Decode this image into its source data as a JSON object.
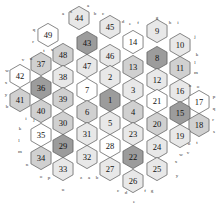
{
  "diagram": {
    "canvas": {
      "width": 220,
      "height": 209,
      "background": "#ffffff"
    },
    "hex": {
      "radius": 11.6,
      "orientation": "pointy-top-flat-side-horizontal",
      "stroke": "#555555",
      "stroke_width": 0.7
    },
    "palette": {
      "white": "#ffffff",
      "light": "#e8e8e8",
      "mid": "#d0d0d0",
      "dark": "#9c9c9c",
      "stroke": "#555555",
      "text": "#111111",
      "edge_text": "#333333"
    },
    "cells": [
      {
        "label": "44",
        "x": 79,
        "y": 18,
        "shade": "light"
      },
      {
        "label": "45",
        "x": 110,
        "y": 27,
        "shade": "light"
      },
      {
        "label": "9",
        "x": 157,
        "y": 31,
        "shade": "light"
      },
      {
        "label": "49",
        "x": 48,
        "y": 35,
        "shade": "white"
      },
      {
        "label": "43",
        "x": 87,
        "y": 43,
        "shade": "dark"
      },
      {
        "label": "14",
        "x": 133,
        "y": 42,
        "shade": "white"
      },
      {
        "label": "10",
        "x": 180,
        "y": 45,
        "shade": "light"
      },
      {
        "label": "48",
        "x": 63,
        "y": 55,
        "shade": "mid"
      },
      {
        "label": "46",
        "x": 110,
        "y": 56,
        "shade": "light"
      },
      {
        "label": "8",
        "x": 157,
        "y": 58,
        "shade": "dark"
      },
      {
        "label": "37",
        "x": 41,
        "y": 64,
        "shade": "mid"
      },
      {
        "label": "47",
        "x": 87,
        "y": 66,
        "shade": "light"
      },
      {
        "label": "13",
        "x": 133,
        "y": 67,
        "shade": "mid"
      },
      {
        "label": "11",
        "x": 180,
        "y": 68,
        "shade": "mid"
      },
      {
        "label": "42",
        "x": 20,
        "y": 76,
        "shade": "white"
      },
      {
        "label": "38",
        "x": 63,
        "y": 77,
        "shade": "light"
      },
      {
        "label": "2",
        "x": 110,
        "y": 77,
        "shade": "light"
      },
      {
        "label": "12",
        "x": 157,
        "y": 80,
        "shade": "light"
      },
      {
        "label": "36",
        "x": 41,
        "y": 88,
        "shade": "dark"
      },
      {
        "label": "7",
        "x": 87,
        "y": 90,
        "shade": "white"
      },
      {
        "label": "3",
        "x": 133,
        "y": 90,
        "shade": "light"
      },
      {
        "label": "16",
        "x": 180,
        "y": 91,
        "shade": "light"
      },
      {
        "label": "41",
        "x": 20,
        "y": 100,
        "shade": "mid"
      },
      {
        "label": "39",
        "x": 63,
        "y": 99,
        "shade": "mid"
      },
      {
        "label": "1",
        "x": 110,
        "y": 100,
        "shade": "dark"
      },
      {
        "label": "21",
        "x": 157,
        "y": 101,
        "shade": "white"
      },
      {
        "label": "17",
        "x": 199,
        "y": 102,
        "shade": "white"
      },
      {
        "label": "40",
        "x": 41,
        "y": 111,
        "shade": "mid"
      },
      {
        "label": "6",
        "x": 87,
        "y": 112,
        "shade": "mid"
      },
      {
        "label": "4",
        "x": 133,
        "y": 112,
        "shade": "mid"
      },
      {
        "label": "15",
        "x": 180,
        "y": 113,
        "shade": "dark"
      },
      {
        "label": "30",
        "x": 63,
        "y": 123,
        "shade": "mid"
      },
      {
        "label": "5",
        "x": 110,
        "y": 123,
        "shade": "light"
      },
      {
        "label": "20",
        "x": 157,
        "y": 124,
        "shade": "mid"
      },
      {
        "label": "18",
        "x": 199,
        "y": 125,
        "shade": "mid"
      },
      {
        "label": "35",
        "x": 41,
        "y": 135,
        "shade": "white"
      },
      {
        "label": "31",
        "x": 87,
        "y": 134,
        "shade": "light"
      },
      {
        "label": "23",
        "x": 133,
        "y": 134,
        "shade": "light"
      },
      {
        "label": "19",
        "x": 180,
        "y": 136,
        "shade": "light"
      },
      {
        "label": "29",
        "x": 63,
        "y": 146,
        "shade": "dark"
      },
      {
        "label": "28",
        "x": 110,
        "y": 146,
        "shade": "white"
      },
      {
        "label": "24",
        "x": 157,
        "y": 147,
        "shade": "light"
      },
      {
        "label": "34",
        "x": 41,
        "y": 158,
        "shade": "mid"
      },
      {
        "label": "32",
        "x": 87,
        "y": 157,
        "shade": "light"
      },
      {
        "label": "22",
        "x": 133,
        "y": 157,
        "shade": "dark"
      },
      {
        "label": "33",
        "x": 63,
        "y": 169,
        "shade": "light"
      },
      {
        "label": "27",
        "x": 110,
        "y": 169,
        "shade": "light"
      },
      {
        "label": "25",
        "x": 157,
        "y": 169,
        "shade": "light"
      },
      {
        "label": "26",
        "x": 133,
        "y": 181,
        "shade": "light"
      }
    ],
    "edge_labels": [
      {
        "text": "a",
        "x": 88,
        "y": 5
      },
      {
        "text": "a",
        "x": 63,
        "y": 13
      },
      {
        "text": "z",
        "x": 71,
        "y": 11
      },
      {
        "text": "b",
        "x": 95,
        "y": 13
      },
      {
        "text": "c",
        "x": 103,
        "y": 13
      },
      {
        "text": "d",
        "x": 123,
        "y": 21
      },
      {
        "text": "e",
        "x": 130,
        "y": 23
      },
      {
        "text": "f",
        "x": 138,
        "y": 22
      },
      {
        "text": "g",
        "x": 157,
        "y": 17
      },
      {
        "text": "h",
        "x": 170,
        "y": 22
      },
      {
        "text": "i",
        "x": 178,
        "y": 22
      },
      {
        "text": "q",
        "x": 34,
        "y": 29
      },
      {
        "text": "r",
        "x": 33,
        "y": 41
      },
      {
        "text": "j",
        "x": 195,
        "y": 36
      },
      {
        "text": "k",
        "x": 197,
        "y": 54
      },
      {
        "text": "t",
        "x": 44,
        "y": 50
      },
      {
        "text": "s",
        "x": 52,
        "y": 49
      },
      {
        "text": "l",
        "x": 195,
        "y": 62
      },
      {
        "text": "m",
        "x": 196,
        "y": 72
      },
      {
        "text": "v",
        "x": 23,
        "y": 59
      },
      {
        "text": "u",
        "x": 31,
        "y": 58
      },
      {
        "text": "w",
        "x": 7,
        "y": 70
      },
      {
        "text": "x",
        "x": 6,
        "y": 82
      },
      {
        "text": "n",
        "x": 190,
        "y": 85
      },
      {
        "text": "o",
        "x": 198,
        "y": 86
      },
      {
        "text": "y",
        "x": 6,
        "y": 94
      },
      {
        "text": "b",
        "x": 7,
        "y": 106
      },
      {
        "text": "p",
        "x": 214,
        "y": 96
      },
      {
        "text": "q",
        "x": 214,
        "y": 108
      },
      {
        "text": "i",
        "x": 26,
        "y": 118
      },
      {
        "text": "j",
        "x": 34,
        "y": 119
      },
      {
        "text": "r",
        "x": 213,
        "y": 119
      },
      {
        "text": "s",
        "x": 214,
        "y": 131
      },
      {
        "text": "k",
        "x": 20,
        "y": 128
      },
      {
        "text": "l",
        "x": 19,
        "y": 140
      },
      {
        "text": "u",
        "x": 189,
        "y": 143
      },
      {
        "text": "t",
        "x": 197,
        "y": 142
      },
      {
        "text": "m",
        "x": 20,
        "y": 151
      },
      {
        "text": "n",
        "x": 27,
        "y": 164
      },
      {
        "text": "w",
        "x": 181,
        "y": 154
      },
      {
        "text": "v",
        "x": 188,
        "y": 152
      },
      {
        "text": "x",
        "x": 176,
        "y": 161
      },
      {
        "text": "y",
        "x": 177,
        "y": 175
      },
      {
        "text": "o",
        "x": 41,
        "y": 176
      },
      {
        "text": "p",
        "x": 49,
        "y": 177
      },
      {
        "text": "z",
        "x": 81,
        "y": 177
      },
      {
        "text": "a",
        "x": 89,
        "y": 177
      },
      {
        "text": "b",
        "x": 97,
        "y": 177
      },
      {
        "text": "u",
        "x": 63,
        "y": 189
      },
      {
        "text": "c",
        "x": 118,
        "y": 190
      },
      {
        "text": "d",
        "x": 126,
        "y": 192
      },
      {
        "text": "f",
        "x": 145,
        "y": 190
      },
      {
        "text": "g",
        "x": 152,
        "y": 190
      },
      {
        "text": "e",
        "x": 134,
        "y": 201
      }
    ]
  }
}
